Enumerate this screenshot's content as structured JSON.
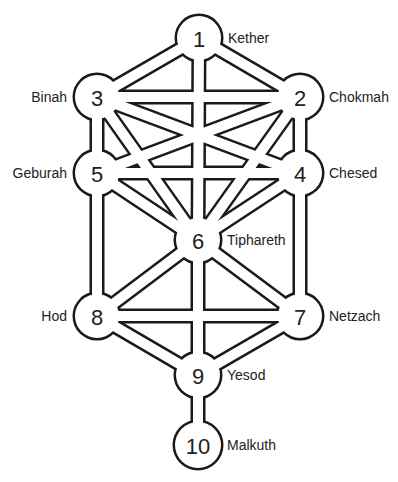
{
  "diagram": {
    "colors": {
      "stroke": "#1a1a1a",
      "fill": "#ffffff",
      "text": "#222222"
    },
    "node_radius": 22,
    "nodes": [
      {
        "id": "1",
        "number": "1",
        "name": "Kether",
        "x": 199,
        "y": 38,
        "label_side": "right"
      },
      {
        "id": "2",
        "number": "2",
        "name": "Chokmah",
        "x": 300,
        "y": 97,
        "label_side": "right"
      },
      {
        "id": "3",
        "number": "3",
        "name": "Binah",
        "x": 97,
        "y": 97,
        "label_side": "left"
      },
      {
        "id": "4",
        "number": "4",
        "name": "Chesed",
        "x": 300,
        "y": 173,
        "label_side": "right"
      },
      {
        "id": "5",
        "number": "5",
        "name": "Geburah",
        "x": 97,
        "y": 173,
        "label_side": "left"
      },
      {
        "id": "6",
        "number": "6",
        "name": "Tiphareth",
        "x": 198,
        "y": 240,
        "label_side": "right"
      },
      {
        "id": "7",
        "number": "7",
        "name": "Netzach",
        "x": 300,
        "y": 316,
        "label_side": "right"
      },
      {
        "id": "8",
        "number": "8",
        "name": "Hod",
        "x": 97,
        "y": 316,
        "label_side": "left"
      },
      {
        "id": "9",
        "number": "9",
        "name": "Yesod",
        "x": 198,
        "y": 375,
        "label_side": "right"
      },
      {
        "id": "10",
        "number": "10",
        "name": "Malkuth",
        "x": 198,
        "y": 445,
        "label_side": "right"
      }
    ],
    "edges": [
      [
        "1",
        "2"
      ],
      [
        "1",
        "3"
      ],
      [
        "1",
        "6"
      ],
      [
        "2",
        "3"
      ],
      [
        "2",
        "4"
      ],
      [
        "2",
        "5"
      ],
      [
        "2",
        "6"
      ],
      [
        "3",
        "4"
      ],
      [
        "3",
        "5"
      ],
      [
        "3",
        "6"
      ],
      [
        "4",
        "5"
      ],
      [
        "4",
        "6"
      ],
      [
        "4",
        "7"
      ],
      [
        "5",
        "6"
      ],
      [
        "5",
        "8"
      ],
      [
        "6",
        "7"
      ],
      [
        "6",
        "8"
      ],
      [
        "6",
        "9"
      ],
      [
        "7",
        "8"
      ],
      [
        "7",
        "9"
      ],
      [
        "8",
        "9"
      ],
      [
        "9",
        "10"
      ]
    ]
  }
}
